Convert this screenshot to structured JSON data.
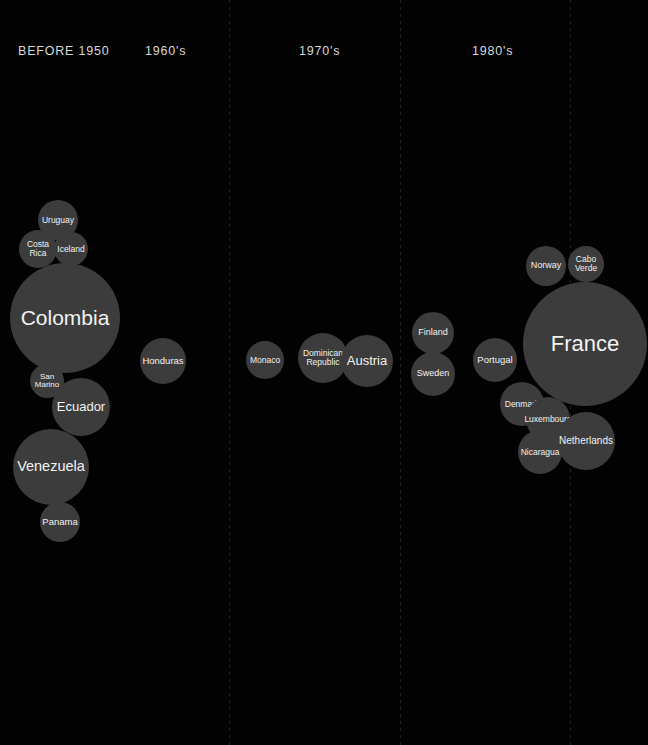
{
  "canvas": {
    "width": 648,
    "height": 745,
    "background_color": "#020202",
    "bubble_color": "#3c3c3c",
    "label_color": "#f2f2f2",
    "divider_color": "#3a3a3a"
  },
  "chart_data": {
    "type": "bubble",
    "title": "",
    "xlabel": "",
    "ylabel": "",
    "legend": "none",
    "grid": "vertical dotted dividers between eras",
    "categories": [
      "BEFORE 1950",
      "1960's",
      "1970's",
      "1980's"
    ],
    "note": "Bubble sizes encode a magnitude per country; radii read off the pixels",
    "series": [
      {
        "name": "BEFORE 1950",
        "bubbles": [
          {
            "label": "Uruguay",
            "cx": 58,
            "cy": 220,
            "r": 20,
            "font": 8.5
          },
          {
            "label": "Costa\nRica",
            "cx": 38,
            "cy": 249,
            "r": 19,
            "font": 8.5
          },
          {
            "label": "Iceland",
            "cx": 71,
            "cy": 249,
            "r": 17,
            "font": 8.5
          },
          {
            "label": "Colombia",
            "cx": 65,
            "cy": 318,
            "r": 55,
            "font": 21
          },
          {
            "label": "San\nMarino",
            "cx": 47,
            "cy": 381,
            "r": 17,
            "font": 8
          },
          {
            "label": "Ecuador",
            "cx": 81,
            "cy": 407,
            "r": 29,
            "font": 13
          },
          {
            "label": "Venezuela",
            "cx": 51,
            "cy": 467,
            "r": 38,
            "font": 14.5
          },
          {
            "label": "Panama",
            "cx": 60,
            "cy": 522,
            "r": 20,
            "font": 9.5
          }
        ]
      },
      {
        "name": "1960's",
        "bubbles": [
          {
            "label": "Honduras",
            "cx": 163,
            "cy": 361,
            "r": 23,
            "font": 9.5
          }
        ]
      },
      {
        "name": "1970's",
        "bubbles": [
          {
            "label": "Monaco",
            "cx": 265,
            "cy": 360,
            "r": 19,
            "font": 8.5
          },
          {
            "label": "Dominican\nRepublic",
            "cx": 323,
            "cy": 358,
            "r": 25,
            "font": 8.5
          },
          {
            "label": "Austria",
            "cx": 367,
            "cy": 361,
            "r": 26,
            "font": 13
          }
        ]
      },
      {
        "name": "1980's",
        "bubbles": [
          {
            "label": "Finland",
            "cx": 433,
            "cy": 333,
            "r": 21,
            "font": 9
          },
          {
            "label": "Sweden",
            "cx": 433,
            "cy": 374,
            "r": 22,
            "font": 9
          },
          {
            "label": "Portugal",
            "cx": 495,
            "cy": 360,
            "r": 22,
            "font": 9.5
          },
          {
            "label": "Norway",
            "cx": 546,
            "cy": 266,
            "r": 20,
            "font": 9
          },
          {
            "label": "Cabo\nVerde",
            "cx": 586,
            "cy": 264,
            "r": 18,
            "font": 8.5
          },
          {
            "label": "France",
            "cx": 585,
            "cy": 344,
            "r": 62,
            "font": 22
          },
          {
            "label": "Denmark",
            "cx": 522,
            "cy": 404,
            "r": 22,
            "font": 8.5
          },
          {
            "label": "Luxembourg",
            "cx": 548,
            "cy": 419,
            "r": 22,
            "font": 8.5
          },
          {
            "label": "Nicaragua",
            "cx": 540,
            "cy": 452,
            "r": 22,
            "font": 8.5
          },
          {
            "label": "Netherlands",
            "cx": 586,
            "cy": 441,
            "r": 29,
            "font": 10
          }
        ]
      }
    ]
  },
  "header": {
    "eras": [
      {
        "label": "BEFORE 1950",
        "x": 18,
        "y": 44
      },
      {
        "label": "1960's",
        "x": 145,
        "y": 44
      },
      {
        "label": "1970's",
        "x": 299,
        "y": 44
      },
      {
        "label": "1980's",
        "x": 472,
        "y": 44
      }
    ]
  },
  "dividers": [
    {
      "x": 229
    },
    {
      "x": 400
    },
    {
      "x": 570
    }
  ]
}
